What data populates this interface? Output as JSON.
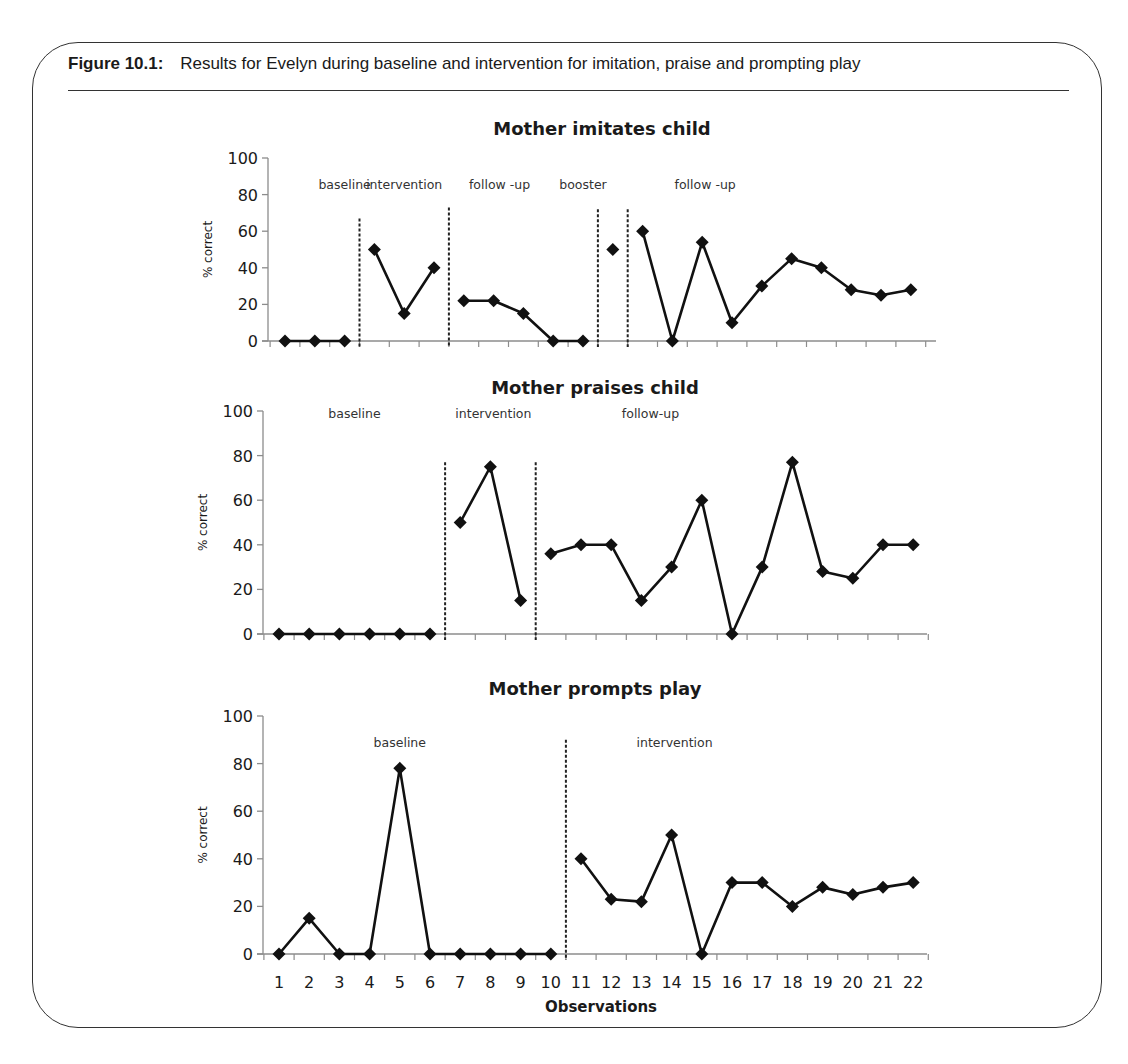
{
  "figure": {
    "label": "Figure 10.1:",
    "caption": "Results for Evelyn during baseline and intervention for imitation, praise and prompting play"
  },
  "colors": {
    "line": "#111111",
    "axis": "#8c8c8c",
    "text": "#1a1a1a",
    "frame": "#333333"
  },
  "chart_data": [
    {
      "type": "line",
      "title": "Mother imitates child",
      "xlabel": "",
      "ylabel": "% correct",
      "ylim": [
        0,
        100
      ],
      "yticks": [
        0,
        20,
        40,
        60,
        80,
        100
      ],
      "x": [
        1,
        2,
        3,
        4,
        5,
        6,
        7,
        8,
        9,
        10,
        11,
        12,
        13,
        14,
        15,
        16,
        17,
        18,
        19,
        20,
        21,
        22
      ],
      "show_xtick_labels": false,
      "grid": false,
      "legend": null,
      "phases": [
        {
          "name": "baseline",
          "label_x": 3.0
        },
        {
          "name": "intervention",
          "label_x": 5.0
        },
        {
          "name": "follow -up",
          "label_x": 8.2
        },
        {
          "name": "booster",
          "label_x": 11.0
        },
        {
          "name": "follow -up",
          "label_x": 15.1
        }
      ],
      "phase_lines": [
        {
          "after_x": 3.5,
          "top": 67
        },
        {
          "after_x": 6.5,
          "top": 73
        },
        {
          "after_x": 11.5,
          "top": 72
        },
        {
          "after_x": 12.5,
          "top": 72
        }
      ],
      "segments": [
        {
          "phase": "baseline",
          "x": [
            1,
            2,
            3
          ],
          "y": [
            0,
            0,
            0
          ]
        },
        {
          "phase": "intervention",
          "x": [
            4,
            5,
            6
          ],
          "y": [
            50,
            15,
            40
          ]
        },
        {
          "phase": "follow-up",
          "x": [
            7,
            8,
            9,
            10,
            11
          ],
          "y": [
            22,
            22,
            15,
            0,
            0
          ]
        },
        {
          "phase": "booster",
          "x": [
            12
          ],
          "y": [
            50
          ]
        },
        {
          "phase": "follow-up",
          "x": [
            13,
            14,
            15,
            16,
            17,
            18,
            19,
            20,
            21,
            22
          ],
          "y": [
            60,
            0,
            54,
            10,
            30,
            45,
            40,
            28,
            25,
            28
          ]
        }
      ],
      "layout": {
        "axis_x": 268,
        "y0": 341,
        "y100": 158,
        "first_x": 285,
        "step": 29.8,
        "axis_end": 936,
        "title_y": 135,
        "phase_label_y": 189
      }
    },
    {
      "type": "line",
      "title": "Mother praises child",
      "xlabel": "",
      "ylabel": "% correct",
      "ylim": [
        0,
        100
      ],
      "yticks": [
        0,
        20,
        40,
        60,
        80,
        100
      ],
      "x": [
        1,
        2,
        3,
        4,
        5,
        6,
        7,
        8,
        9,
        10,
        11,
        12,
        13,
        14,
        15,
        16,
        17,
        18,
        19,
        20,
        21,
        22
      ],
      "show_xtick_labels": false,
      "grid": false,
      "legend": null,
      "phases": [
        {
          "name": "baseline",
          "label_x": 3.5
        },
        {
          "name": "intervention",
          "label_x": 8.1
        },
        {
          "name": "follow-up",
          "label_x": 13.3
        }
      ],
      "phase_lines": [
        {
          "after_x": 6.5,
          "top": 77
        },
        {
          "after_x": 9.5,
          "top": 77
        }
      ],
      "segments": [
        {
          "phase": "baseline",
          "x": [
            1,
            2,
            3,
            4,
            5,
            6
          ],
          "y": [
            0,
            0,
            0,
            0,
            0,
            0
          ]
        },
        {
          "phase": "intervention",
          "x": [
            7,
            8,
            9
          ],
          "y": [
            50,
            75,
            15
          ]
        },
        {
          "phase": "follow-up",
          "x": [
            10,
            11,
            12,
            13,
            14,
            15,
            16,
            17,
            18,
            19,
            20,
            21,
            22
          ],
          "y": [
            36,
            40,
            40,
            15,
            30,
            60,
            0,
            30,
            77,
            28,
            25,
            40,
            40
          ]
        }
      ],
      "layout": {
        "axis_x": 263,
        "y0": 634,
        "y100": 411,
        "first_x": 279,
        "step": 30.2,
        "axis_end": 927,
        "title_y": 394,
        "phase_label_y": 418
      }
    },
    {
      "type": "line",
      "title": "Mother prompts play",
      "xlabel": "Observations",
      "ylabel": "% correct",
      "ylim": [
        0,
        100
      ],
      "yticks": [
        0,
        20,
        40,
        60,
        80,
        100
      ],
      "x": [
        1,
        2,
        3,
        4,
        5,
        6,
        7,
        8,
        9,
        10,
        11,
        12,
        13,
        14,
        15,
        16,
        17,
        18,
        19,
        20,
        21,
        22
      ],
      "show_xtick_labels": true,
      "grid": false,
      "legend": null,
      "phases": [
        {
          "name": "baseline",
          "label_x": 5.0
        },
        {
          "name": "intervention",
          "label_x": 14.1
        }
      ],
      "phase_lines": [
        {
          "after_x": 10.5,
          "top": 90
        }
      ],
      "segments": [
        {
          "phase": "baseline",
          "x": [
            1,
            2,
            3,
            4,
            5,
            6,
            7,
            8,
            9,
            10
          ],
          "y": [
            0,
            15,
            0,
            0,
            78,
            0,
            0,
            0,
            0,
            0
          ]
        },
        {
          "phase": "intervention",
          "x": [
            11,
            12,
            13,
            14,
            15,
            16,
            17,
            18,
            19,
            20,
            21,
            22
          ],
          "y": [
            40,
            23,
            22,
            50,
            0,
            30,
            30,
            20,
            28,
            25,
            28,
            30
          ]
        }
      ],
      "layout": {
        "axis_x": 263,
        "y0": 954,
        "y100": 716,
        "first_x": 279,
        "step": 30.2,
        "axis_end": 927,
        "title_y": 695,
        "phase_label_y": 747,
        "xtick_label_y": 988,
        "xlabel_y": 1012
      }
    }
  ]
}
